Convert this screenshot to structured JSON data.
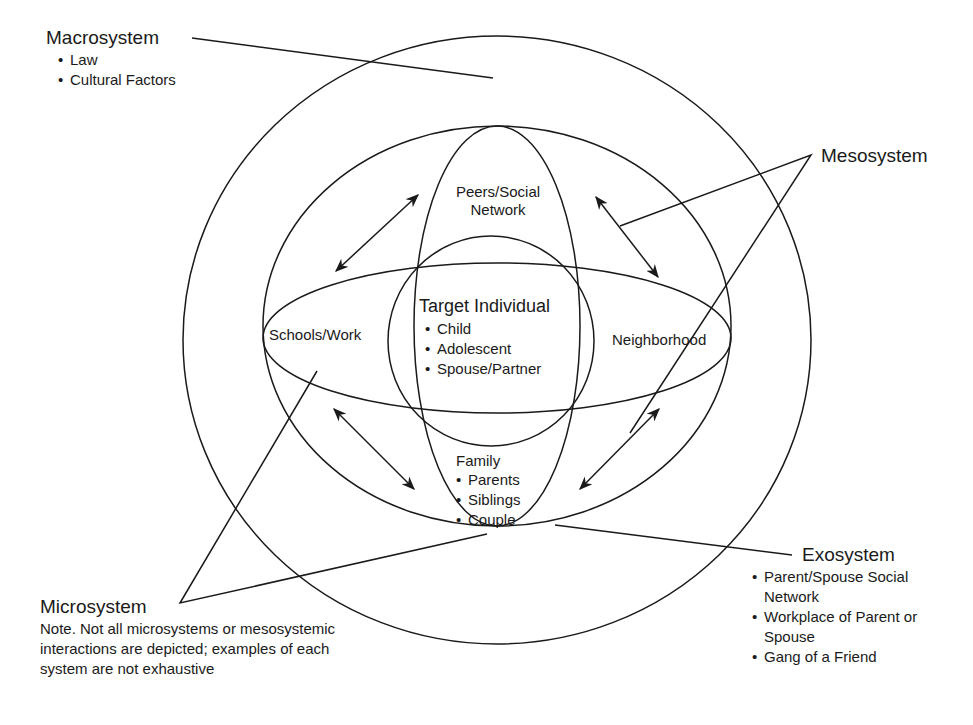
{
  "diagram": {
    "type": "ecological-systems-model",
    "stroke_color": "#1a1a1a",
    "background": "#ffffff"
  },
  "macrosystem": {
    "title": "Macrosystem",
    "items": [
      "Law",
      "Cultural Factors"
    ]
  },
  "mesosystem": {
    "title": "Mesosystem"
  },
  "exosystem": {
    "title": "Exosystem",
    "items": [
      "Parent/Spouse Social Network",
      "Workplace of Parent or Spouse",
      "Gang of a Friend"
    ]
  },
  "microsystem": {
    "title": "Microsystem",
    "note": "Note. Not all microsystems or mesosystemic interactions are depicted; examples of each system are not exhaustive"
  },
  "center": {
    "title": "Target Individual",
    "items": [
      "Child",
      "Adolescent",
      "Spouse/Partner"
    ]
  },
  "nodes": {
    "peers_line1": "Peers/Social",
    "peers_line2": "Network",
    "schools": "Schools/Work",
    "neighborhood": "Neighborhood",
    "family": {
      "title": "Family",
      "items": [
        "Parents",
        "Siblings",
        "Couple"
      ]
    }
  }
}
